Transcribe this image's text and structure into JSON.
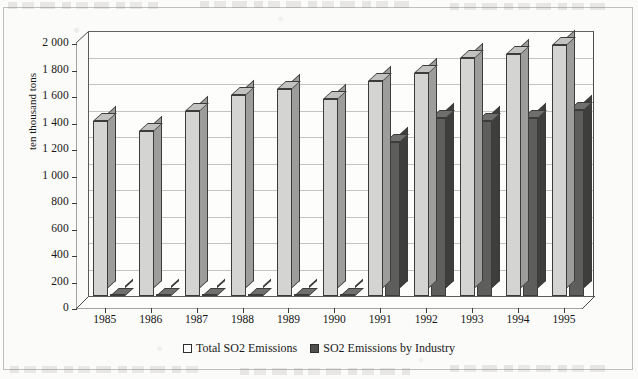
{
  "chart_data": {
    "type": "bar",
    "title": "",
    "subtitle": "",
    "xlabel": "",
    "ylabel": "ten thousand tons",
    "ylim": [
      0,
      2000
    ],
    "ytick_step": 200,
    "ytick_labels": [
      "0",
      "200",
      "400",
      "600",
      "800",
      "1 000",
      "1 200",
      "1 400",
      "1 600",
      "1 800",
      "2 000"
    ],
    "grid": true,
    "legend_position": "bottom-center",
    "style": "3d-clustered-column",
    "categories": [
      "1985",
      "1986",
      "1987",
      "1988",
      "1989",
      "1990",
      "1991",
      "1992",
      "1993",
      "1994",
      "1995"
    ],
    "series": [
      {
        "name": "Total  SO2 Emissions",
        "color": "#d4d4d2",
        "values": [
          1322,
          1245,
          1396,
          1514,
          1564,
          1489,
          1622,
          1685,
          1795,
          1825,
          1891
        ]
      },
      {
        "name": "SO2 Emissions by Industry",
        "color": "#5e5e5c",
        "values": [
          0,
          0,
          0,
          0,
          0,
          0,
          1165,
          1340,
          1320,
          1344,
          1405
        ]
      }
    ]
  },
  "axis": {
    "y_title": "ten thousand tons"
  },
  "legend": {
    "items": [
      {
        "label": "Total  SO2 Emissions",
        "swatch": "light-square-icon"
      },
      {
        "label": "SO2 Emissions by Industry",
        "swatch": "dark-square-icon"
      }
    ]
  },
  "colors": {
    "series_total_face": "#d4d4d2",
    "series_total_side": "#9d9d9b",
    "series_industry_face": "#5e5e5c",
    "series_industry_side": "#3e3e3c",
    "gridline": "#6e6e6c",
    "page_background": "#fbfbf9"
  }
}
